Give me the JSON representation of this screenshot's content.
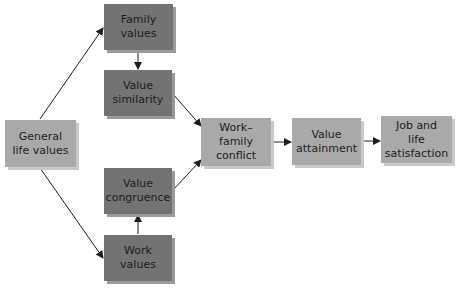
{
  "diagram": {
    "nodes": {
      "general_life_values": {
        "label": "General life values",
        "line1": "General",
        "line2": "life values"
      },
      "family_values": {
        "label": "Family values",
        "line1": "Family",
        "line2": "values"
      },
      "value_similarity": {
        "label": "Value similarity",
        "line1": "Value",
        "line2": "similarity"
      },
      "value_congruence": {
        "label": "Value congruence",
        "line1": "Value",
        "line2": "congruence"
      },
      "work_values": {
        "label": "Work values",
        "line1": "Work",
        "line2": "values"
      },
      "work_family_conflict": {
        "label": "Work–family conflict",
        "line1": "Work–family",
        "line2": "conflict"
      },
      "value_attainment": {
        "label": "Value attainment",
        "line1": "Value",
        "line2": "attainment"
      },
      "job_life_satisfaction": {
        "label": "Job and life satisfaction",
        "line1": "Job and",
        "line2": "life",
        "line3": "satisfaction"
      }
    },
    "edges": [
      {
        "from": "General life values",
        "to": "Family values"
      },
      {
        "from": "General life values",
        "to": "Work values"
      },
      {
        "from": "Family values",
        "to": "Value similarity"
      },
      {
        "from": "Work values",
        "to": "Value congruence"
      },
      {
        "from": "Value similarity",
        "to": "Work–family conflict"
      },
      {
        "from": "Value congruence",
        "to": "Work–family conflict"
      },
      {
        "from": "Work–family conflict",
        "to": "Value attainment"
      },
      {
        "from": "Value attainment",
        "to": "Job and life satisfaction"
      }
    ],
    "colors": {
      "dark_box": "#737373",
      "light_box": "#a9a9a9",
      "arrow": "#1e1e1e"
    }
  }
}
